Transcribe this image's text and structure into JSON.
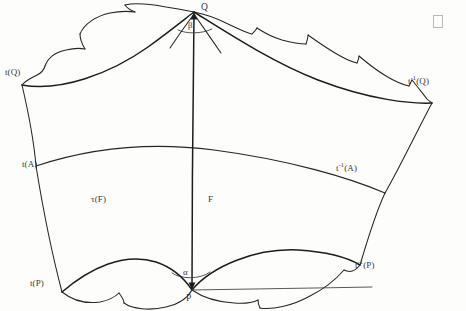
{
  "figure": {
    "type": "hyperbolic-polygon-diagram",
    "background_color": "#fdfdfb",
    "ink_color": "#262626"
  },
  "labels": {
    "vertex_Q": "Q",
    "vertex_P": "P",
    "angle_beta": "β",
    "angle_alpha": "α",
    "left_top": "t(Q)",
    "left_mid": "t(A)",
    "left_bottom": "t(P)",
    "right_top_prefix": "t",
    "right_top_exp": "-1",
    "right_top_suffix": "(Q)",
    "right_mid_prefix": "t",
    "right_mid_exp": "-1",
    "right_mid_suffix": "(A)",
    "right_bottom_prefix": "t",
    "right_bottom_exp": "-1",
    "right_bottom_suffix": "(P)",
    "region_left": "τ(F)",
    "region_right": "F"
  },
  "geometry": {
    "vertices": {
      "Q": [
        194,
        12
      ],
      "P": [
        192,
        290
      ],
      "t_Q": [
        22,
        85
      ],
      "t_A": [
        36,
        166
      ],
      "t_P": [
        62,
        292
      ],
      "tinv_Q": [
        432,
        103
      ],
      "tinv_A": [
        385,
        193
      ],
      "tinv_P": [
        360,
        265
      ]
    },
    "chart_note": "coordinates are pixel positions of the labelled vertices in the 466x311 canvas"
  },
  "corner_mark": {
    "shape": "hollow-rectangle",
    "x": 433,
    "y": 15,
    "width": 8,
    "height": 11,
    "color": "#b9b9b9"
  }
}
